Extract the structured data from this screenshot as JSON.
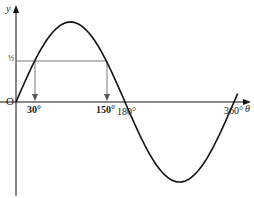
{
  "diagram": {
    "axis_labels": {
      "y": "y",
      "x": "θ",
      "origin": "O"
    },
    "y_tick_label": "½",
    "x_tick_labels": {
      "a": "30°",
      "b": "150°",
      "c": "180°",
      "d": "360°"
    },
    "colors": {
      "curve": "#111111",
      "axis": "#111111",
      "guide": "#555555"
    }
  },
  "chart_data": {
    "type": "line",
    "xlabel": "θ",
    "ylabel": "y",
    "x": [
      0,
      30,
      90,
      150,
      180,
      270,
      360
    ],
    "values": [
      0,
      0.5,
      1,
      0.5,
      0,
      -1,
      0
    ],
    "annotations": [
      "y = 1/2 horizontal line meets curve at θ = 30° and θ = 150°",
      "arrows drop to x-axis at 30° and 150°"
    ],
    "xlim": [
      0,
      360
    ],
    "ylim": [
      -1,
      1
    ],
    "grid": false
  }
}
